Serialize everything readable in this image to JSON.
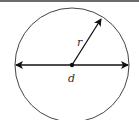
{
  "diagram": {
    "labels": {
      "radius": "r",
      "diameter": "d"
    },
    "colors": {
      "stroke": "#111111",
      "circle": "#444444",
      "text": "#333333",
      "top_bar": "#6b6b6b"
    }
  }
}
